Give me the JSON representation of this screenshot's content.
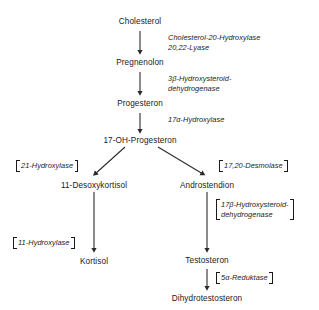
{
  "diagram": {
    "line_color": "#2b2b2b",
    "text_color": "#1a1a1a",
    "background": "#ffffff",
    "nodes": [
      {
        "id": "cholesterol",
        "label": "Cholesterol"
      },
      {
        "id": "pregnenolon",
        "label": "Pregnenolon"
      },
      {
        "id": "progesteron",
        "label": "Progesteron"
      },
      {
        "id": "oh_progesteron",
        "label": "17-OH-Progesteron"
      },
      {
        "id": "desoxykortisol",
        "label": "11-Desoxykortisol"
      },
      {
        "id": "androstendion",
        "label": "Androstendion"
      },
      {
        "id": "kortisol",
        "label": "Kortisol"
      },
      {
        "id": "testosteron",
        "label": "Testosteron"
      },
      {
        "id": "dihydrotestosteron",
        "label": "Dihydrotestosteron"
      }
    ],
    "enzymes": [
      {
        "id": "chol_20_hydroxylase",
        "lines": [
          "Cholesterol-20-Hydroxylase",
          "20,22-Lyase"
        ],
        "bracketed": false
      },
      {
        "id": "hsd_3beta",
        "lines": [
          "3β-Hydroxysteroid-",
          "dehydrogenase"
        ],
        "bracketed": false
      },
      {
        "id": "hydroxylase_17alpha",
        "lines": [
          "17α-Hydroxylase"
        ],
        "bracketed": false
      },
      {
        "id": "hydroxylase_21",
        "lines": [
          "21-Hydroxylase"
        ],
        "bracketed": true
      },
      {
        "id": "desmolase_17_20",
        "lines": [
          "17,20-Desmolase"
        ],
        "bracketed": true
      },
      {
        "id": "hsd_17beta",
        "lines": [
          "17β-Hydroxysteroid-",
          "dehydrogenase"
        ],
        "bracketed": true
      },
      {
        "id": "hydroxylase_11",
        "lines": [
          "11-Hydroxylase"
        ],
        "bracketed": true
      },
      {
        "id": "reduktase_5alpha",
        "lines": [
          "5α-Reduktase"
        ],
        "bracketed": true
      }
    ]
  }
}
